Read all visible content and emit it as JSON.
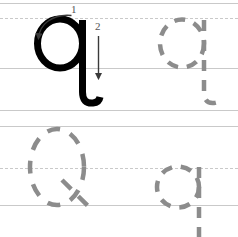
{
  "worksheet": {
    "title": "Lowercase letter q tracing practice",
    "letter": "q",
    "letter_case": "lowercase",
    "background_color": "#ffffff",
    "guide_line_color": "#c9c9c9",
    "model_letter_color": "#000000",
    "trace_letter_color": "#8c8c8c"
  },
  "guides": {
    "rows": [
      {
        "name": "row-1",
        "top_line_y": 3,
        "midline_y": 18,
        "baseline_y": 68,
        "descender_line_y": 110,
        "top_style": "solid",
        "midline_style": "dashed",
        "baseline_style": "solid",
        "descender_style": "solid"
      },
      {
        "name": "row-2",
        "top_line_y": 126,
        "midline_y": 168,
        "baseline_y": 205,
        "top_style": "solid",
        "midline_style": "dashed",
        "baseline_style": "solid"
      }
    ]
  },
  "stroke_numbers": [
    {
      "label": "1",
      "x": 71,
      "y": 4
    },
    {
      "label": "2",
      "x": 95,
      "y": 21
    }
  ],
  "stroke_arrows": [
    {
      "name": "arrow-1-curve",
      "description": "curved arrow sweeping leftward over the bowl, arrowhead pointing down-left"
    },
    {
      "name": "arrow-2-straight",
      "description": "straight vertical arrow down the stem, arrowhead pointing down"
    }
  ],
  "letters": [
    {
      "name": "model-letter-q",
      "style": "solid",
      "row": 1,
      "position": "left"
    },
    {
      "name": "trace-letter-q-1",
      "style": "dashed",
      "row": 1,
      "position": "right"
    },
    {
      "name": "trace-letter-q-2",
      "style": "dashed",
      "row": 2,
      "position": "left"
    },
    {
      "name": "trace-letter-q-3",
      "style": "dashed",
      "row": 2,
      "position": "right"
    }
  ]
}
